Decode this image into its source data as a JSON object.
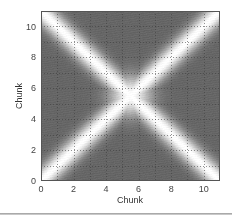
{
  "chart_data": {
    "type": "heatmap",
    "title": "",
    "xlabel": "Chunk",
    "ylabel": "Chunk",
    "xlim": [
      0,
      11
    ],
    "ylim": [
      0,
      11
    ],
    "xticks": [
      0,
      2,
      4,
      6,
      8,
      10
    ],
    "yticks": [
      0,
      2,
      4,
      6,
      8,
      10
    ],
    "xtick_labels": [
      "0",
      "2",
      "4",
      "6",
      "8",
      "10"
    ],
    "ytick_labels": [
      "0",
      "2",
      "4",
      "6",
      "8",
      "10"
    ],
    "grid": true,
    "grid_step": 1,
    "colormap": "gray",
    "background_value": 0.4,
    "features": [
      {
        "name": "diagonal band",
        "from": [
          0,
          0
        ],
        "to": [
          11,
          11
        ],
        "peak": 1.0,
        "width": 0.45
      },
      {
        "name": "anti-diagonal band",
        "from": [
          0,
          11
        ],
        "to": [
          11,
          0
        ],
        "peak": 1.0,
        "width": 0.45
      },
      {
        "name": "central bright region",
        "center": [
          5.5,
          5.5
        ],
        "radius": 0.9,
        "peak": 1.0
      }
    ]
  },
  "colors": {
    "background_gray": "#6e6e6e",
    "band_peak": "#ffffff",
    "grid_line": "#3a3a3a",
    "frame": "#555555"
  }
}
